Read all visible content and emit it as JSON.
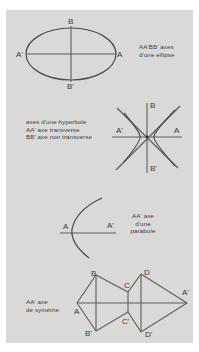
{
  "figures": {
    "ellipse": {
      "labels": {
        "top": "B",
        "bottom": "B'",
        "left": "A'",
        "right": "A"
      },
      "caption": [
        "AA'BB' axes",
        "d'une ellipse"
      ]
    },
    "hyperbola": {
      "labels": {
        "top": "B",
        "bottom": "B'",
        "left": "A'",
        "right": "A"
      },
      "caption": [
        "axes d'une hyperbole",
        "AA' axe transverse",
        "BB' axe non transverse"
      ]
    },
    "parabola": {
      "labels": {
        "vertex": "A",
        "axis_end": "A'"
      },
      "caption": [
        "AA' axe",
        "d'une",
        "parabole"
      ]
    },
    "symmetry": {
      "labels": {
        "A": "A",
        "A_prime": "A'",
        "B": "B",
        "B_prime": "B'",
        "C": "C",
        "C_prime": "C'",
        "D": "D",
        "D_prime": "D'"
      },
      "caption": [
        "AA' axe",
        "de symétrie"
      ]
    }
  },
  "colors": {
    "panel": "#d9d9d7",
    "ink": "#3a3a3e"
  }
}
